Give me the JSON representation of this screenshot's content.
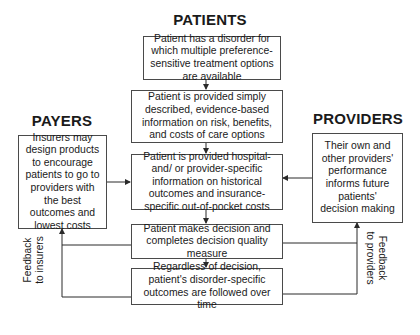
{
  "headings": {
    "patients": "PATIENTS",
    "payers": "PAYERS",
    "providers": "PROVIDERS"
  },
  "patient_flow": [
    {
      "text": "Patient has a disorder for which multiple preference-sensitive treatment options are available"
    },
    {
      "text": "Patient is provided simply described, evidence-based information on risk, benefits, and costs of care options"
    },
    {
      "text": "Patient is provided hospital- and/ or provider-specific information on historical outcomes and insurance-specific out-of-pocket costs"
    },
    {
      "text": "Patient makes decision and completes decision quality measure"
    },
    {
      "text": "Regardless of decision, patient's disorder-specific outcomes are followed over time"
    }
  ],
  "payers_box": {
    "text": "Insurers may design products to encourage patients to go to providers with the best outcomes and lowest costs"
  },
  "providers_box": {
    "text": "Their own and other providers' performance informs future patients' decision making"
  },
  "feedback": {
    "insurers": {
      "line1": "Feedback",
      "line2": "to insurers"
    },
    "providers": {
      "line1": "Feedback",
      "line2": "to providers"
    }
  },
  "colors": {
    "line": "#2a2a2a",
    "box_border": "#4a4a4a",
    "text": "#1a1a1a"
  }
}
